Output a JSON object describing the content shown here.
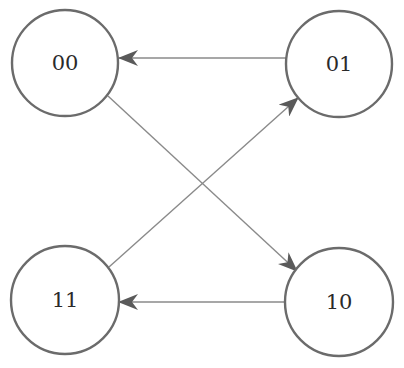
{
  "diagram": {
    "type": "state-transition",
    "colors": {
      "node_stroke": "#6b6b6b",
      "edge": "#8a8a8a",
      "arrowhead": "#5a5a5a",
      "text": "#2a2a2a",
      "background": "#ffffff"
    },
    "nodes": [
      {
        "id": "00",
        "label": "00",
        "cx": 65,
        "cy": 63,
        "r": 53
      },
      {
        "id": "01",
        "label": "01",
        "cx": 339,
        "cy": 64,
        "r": 53
      },
      {
        "id": "11",
        "label": "11",
        "cx": 65,
        "cy": 300,
        "r": 54
      },
      {
        "id": "10",
        "label": "10",
        "cx": 339,
        "cy": 302,
        "r": 54
      }
    ],
    "edges": [
      {
        "from": "01",
        "to": "00",
        "x1": 286,
        "y1": 58,
        "x2": 119,
        "y2": 58
      },
      {
        "from": "00",
        "to": "10",
        "x1": 108,
        "y1": 96,
        "x2": 297,
        "y2": 271
      },
      {
        "from": "11",
        "to": "01",
        "x1": 109,
        "y1": 267,
        "x2": 298,
        "y2": 98
      },
      {
        "from": "10",
        "to": "11",
        "x1": 286,
        "y1": 302,
        "x2": 119,
        "y2": 302
      }
    ]
  }
}
